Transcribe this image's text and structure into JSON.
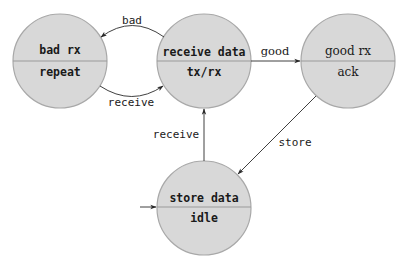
{
  "diagram": {
    "type": "state-machine",
    "colors": {
      "state_fill": "#d8d8d8",
      "state_stroke": "#a8a8a8",
      "edge": "#2a2a2a",
      "text": "#1a1a1a",
      "background": "#ffffff"
    },
    "states": [
      {
        "id": "bad_rx",
        "top": "bad rx",
        "bottom": "repeat",
        "cx": 60,
        "cy": 61,
        "r": 47
      },
      {
        "id": "receive_data",
        "top": "receive data",
        "bottom": "tx/rx",
        "cx": 204,
        "cy": 61,
        "r": 47
      },
      {
        "id": "good_rx",
        "top": "good rx",
        "bottom": "ack",
        "cx": 348,
        "cy": 61,
        "r": 47
      },
      {
        "id": "store_data",
        "top": "store data",
        "bottom": "idle",
        "cx": 204,
        "cy": 208,
        "r": 47,
        "initial": true
      }
    ],
    "transitions": [
      {
        "from": "receive_data",
        "to": "bad_rx",
        "label": "bad"
      },
      {
        "from": "bad_rx",
        "to": "receive_data",
        "label": "receive"
      },
      {
        "from": "receive_data",
        "to": "good_rx",
        "label": "good"
      },
      {
        "from": "good_rx",
        "to": "store_data",
        "label": "store"
      },
      {
        "from": "store_data",
        "to": "receive_data",
        "label": "receive"
      }
    ]
  }
}
